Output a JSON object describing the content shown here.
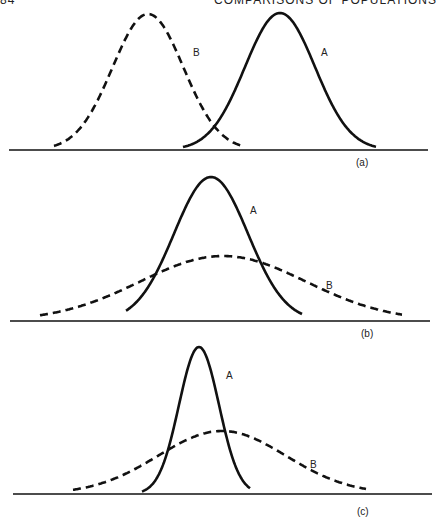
{
  "header": {
    "page_number": "84",
    "running_title": "COMPARISONS OF POPULATIONS"
  },
  "colors": {
    "ink": "#111111",
    "background": "#ffffff"
  },
  "chart_data": [
    {
      "type": "line",
      "panel": "(a)",
      "title": "",
      "xlabel": "",
      "ylabel": "",
      "grid": false,
      "description": "Two normal curves of equal spread, different means",
      "baseline_y": 150,
      "axis_x": [
        9,
        428
      ],
      "series": [
        {
          "name": "A",
          "style": "solid",
          "mean_x": 280,
          "peak_y": 13,
          "sigma": 35,
          "x_range": [
            183,
            376
          ],
          "label_pos": [
            321,
            56
          ]
        },
        {
          "name": "B",
          "style": "dashed",
          "mean_x": 148,
          "peak_y": 14,
          "sigma": 35.5,
          "x_range": [
            54,
            245
          ],
          "label_pos": [
            193,
            56
          ]
        }
      ],
      "panel_label_pos": [
        356,
        166
      ]
    },
    {
      "type": "line",
      "panel": "(b)",
      "title": "",
      "xlabel": "",
      "ylabel": "",
      "grid": false,
      "description": "Similar means, B has much larger spread than A",
      "baseline_y": 321,
      "axis_x": [
        10,
        430
      ],
      "series": [
        {
          "name": "A",
          "style": "solid",
          "mean_x": 211,
          "peak_y": 177,
          "sigma": 37,
          "x_range": [
            126,
            302
          ],
          "label_pos": [
            250,
            214
          ]
        },
        {
          "name": "B",
          "style": "dashed",
          "mean_x": 223,
          "peak_y": 256,
          "sigma": 83,
          "x_range": [
            40,
            402
          ],
          "label_pos": [
            326,
            289
          ]
        }
      ],
      "panel_label_pos": [
        361,
        337
      ]
    },
    {
      "type": "line",
      "panel": "(c)",
      "title": "",
      "xlabel": "",
      "ylabel": "",
      "grid": false,
      "description": "A narrow and tall, B wide and flat, B mean slightly right of A",
      "baseline_y": 494,
      "axis_x": [
        13,
        432
      ],
      "series": [
        {
          "name": "A",
          "style": "solid",
          "mean_x": 199,
          "peak_y": 347,
          "sigma": 20,
          "x_range": [
            142,
            250
          ],
          "label_pos": [
            226,
            379
          ]
        },
        {
          "name": "B",
          "style": "dashed",
          "mean_x": 222,
          "peak_y": 431,
          "sigma": 64,
          "x_range": [
            73,
            366
          ],
          "label_pos": [
            310,
            468
          ]
        }
      ],
      "panel_label_pos": [
        357,
        515
      ]
    }
  ]
}
